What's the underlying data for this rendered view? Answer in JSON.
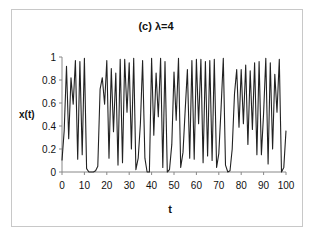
{
  "chart_data": {
    "type": "line",
    "title": "(c) λ=4",
    "xlabel": "t",
    "ylabel": "x(t)",
    "xlim": [
      0,
      100
    ],
    "ylim": [
      0,
      1
    ],
    "xticks": [
      0,
      10,
      20,
      30,
      40,
      50,
      60,
      70,
      80,
      90,
      100
    ],
    "yticks": [
      0,
      0.2,
      0.4,
      0.6,
      0.8,
      1
    ],
    "ytick_labels": [
      "0",
      "0.2",
      "0.4",
      "0.6",
      "0.8",
      "1"
    ],
    "grid": false,
    "legend": null,
    "series": [
      {
        "name": "x(t)",
        "color": "#222222",
        "x": [
          0,
          1,
          2,
          3,
          4,
          5,
          6,
          7,
          8,
          9,
          10,
          11,
          12,
          13,
          14,
          15,
          16,
          17,
          18,
          19,
          20,
          21,
          22,
          23,
          24,
          25,
          26,
          27,
          28,
          29,
          30,
          31,
          32,
          33,
          34,
          35,
          36,
          37,
          38,
          39,
          40,
          41,
          42,
          43,
          44,
          45,
          46,
          47,
          48,
          49,
          50,
          51,
          52,
          53,
          54,
          55,
          56,
          57,
          58,
          59,
          60,
          61,
          62,
          63,
          64,
          65,
          66,
          67,
          68,
          69,
          70,
          71,
          72,
          73,
          74,
          75,
          76,
          77,
          78,
          79,
          80,
          81,
          82,
          83,
          84,
          85,
          86,
          87,
          88,
          89,
          90,
          91,
          92,
          93,
          94,
          95,
          96,
          97,
          98,
          99,
          100
        ],
        "values": [
          0.1,
          0.36,
          0.92,
          0.29,
          0.82,
          0.59,
          0.97,
          0.11,
          0.96,
          0.15,
          0.99,
          0.03,
          0.0,
          0.0,
          0.0,
          0.01,
          0.05,
          0.72,
          0.82,
          0.59,
          0.97,
          0.12,
          0.9,
          0.35,
          0.86,
          0.06,
          0.98,
          0.08,
          0.98,
          0.52,
          0.95,
          0.2,
          0.99,
          0.02,
          0.12,
          0.42,
          0.97,
          0.12,
          0.0,
          0.0,
          0.99,
          0.32,
          0.86,
          0.48,
          0.99,
          0.04,
          0.96,
          0.0,
          0.02,
          0.24,
          0.87,
          0.45,
          0.99,
          0.04,
          0.17,
          0.54,
          0.89,
          0.12,
          0.97,
          0.11,
          0.98,
          0.42,
          0.98,
          0.08,
          0.96,
          0.14,
          0.97,
          0.1,
          0.98,
          0.04,
          0.16,
          0.54,
          0.99,
          0.06,
          0.0,
          0.01,
          0.2,
          0.68,
          0.89,
          0.39,
          0.89,
          0.42,
          0.93,
          0.24,
          0.88,
          0.37,
          0.95,
          0.15,
          0.96,
          0.15,
          0.51,
          0.99,
          0.07,
          0.95,
          0.2,
          0.85,
          0.52,
          0.98,
          0.0,
          0.04,
          0.36
        ]
      }
    ]
  }
}
